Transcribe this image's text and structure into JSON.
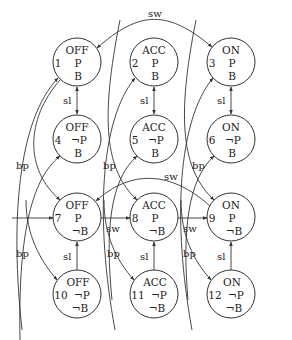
{
  "diagram": {
    "type": "state-machine",
    "nodes": [
      {
        "id": "1",
        "state": "OFF",
        "p": "P",
        "b": "B",
        "cx": 77,
        "cy": 62
      },
      {
        "id": "2",
        "state": "ACC",
        "p": "P",
        "b": "B",
        "cx": 154,
        "cy": 62
      },
      {
        "id": "3",
        "state": "ON",
        "p": "P",
        "b": "B",
        "cx": 231,
        "cy": 62
      },
      {
        "id": "4",
        "state": "OFF",
        "p": "¬P",
        "b": "B",
        "cx": 77,
        "cy": 139
      },
      {
        "id": "5",
        "state": "ACC",
        "p": "¬P",
        "b": "B",
        "cx": 154,
        "cy": 139
      },
      {
        "id": "6",
        "state": "ON",
        "p": "¬P",
        "b": "B",
        "cx": 231,
        "cy": 139
      },
      {
        "id": "7",
        "state": "OFF",
        "p": "P",
        "b": "¬B",
        "cx": 77,
        "cy": 217
      },
      {
        "id": "8",
        "state": "ACC",
        "p": "P",
        "b": "¬B",
        "cx": 154,
        "cy": 217
      },
      {
        "id": "9",
        "state": "ON",
        "p": "P",
        "b": "¬B",
        "cx": 231,
        "cy": 217
      },
      {
        "id": "10",
        "state": "OFF",
        "p": "¬P",
        "b": "¬B",
        "cx": 77,
        "cy": 294
      },
      {
        "id": "11",
        "state": "ACC",
        "p": "¬P",
        "b": "¬B",
        "cx": 154,
        "cy": 294
      },
      {
        "id": "12",
        "state": "ON",
        "p": "¬P",
        "b": "¬B",
        "cx": 231,
        "cy": 294
      }
    ],
    "edge_labels": {
      "sw_top": "sw",
      "sw_mid": "sw",
      "sw_78": "sw",
      "sw_89": "sw",
      "sl_14": "sl",
      "sl_25": "sl",
      "sl_36": "sl",
      "sl_107": "sl",
      "sl_118": "sl",
      "sl_129": "sl",
      "bp_left_upper": "bp",
      "bp_left_lower": "bp",
      "bp_mid_upper": "bp",
      "bp_mid_lower": "bp",
      "bp_right_upper": "bp",
      "bp_right_lower": "bp"
    },
    "edges": [
      {
        "from": "1",
        "to": "3",
        "label": "sw",
        "bidirectional": true
      },
      {
        "from": "1",
        "to": "4",
        "label": "sl",
        "bidirectional": true
      },
      {
        "from": "2",
        "to": "5",
        "label": "sl",
        "bidirectional": true
      },
      {
        "from": "3",
        "to": "6",
        "label": "sl",
        "bidirectional": true
      },
      {
        "from": "10",
        "to": "7",
        "label": "sl"
      },
      {
        "from": "11",
        "to": "8",
        "label": "sl"
      },
      {
        "from": "12",
        "to": "9",
        "label": "sl"
      },
      {
        "from": "start",
        "to": "7",
        "label": ""
      },
      {
        "from": "7",
        "to": "8",
        "label": "sw"
      },
      {
        "from": "8",
        "to": "9",
        "label": "sw"
      },
      {
        "from": "9",
        "to": "7",
        "label": "sw"
      },
      {
        "from": "1",
        "to": "7",
        "label": "bp"
      },
      {
        "from": "7",
        "to": "1",
        "label": "bp"
      },
      {
        "from": "4",
        "to": "10",
        "label": "bp"
      },
      {
        "from": "10",
        "to": "4",
        "label": "bp"
      },
      {
        "from": "2",
        "to": "8",
        "label": "bp"
      },
      {
        "from": "8",
        "to": "2",
        "label": "bp"
      },
      {
        "from": "5",
        "to": "11",
        "label": "bp"
      },
      {
        "from": "11",
        "to": "5",
        "label": "bp"
      },
      {
        "from": "3",
        "to": "9",
        "label": "bp"
      },
      {
        "from": "9",
        "to": "3",
        "label": "bp"
      },
      {
        "from": "6",
        "to": "12",
        "label": "bp"
      },
      {
        "from": "12",
        "to": "6",
        "label": "bp"
      }
    ]
  }
}
